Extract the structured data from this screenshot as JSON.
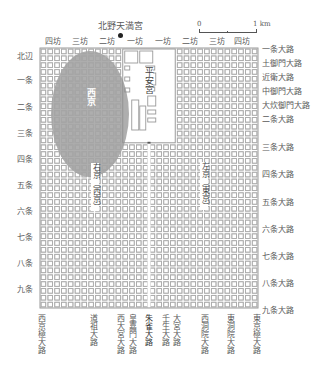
{
  "title": "北野天満宮",
  "landmark": {
    "label": "北野天満宮",
    "marker": "dot-marker"
  },
  "scale_bar": {
    "start": "0",
    "end": "1 km"
  },
  "top_bo_labels": [
    "四坊",
    "三坊",
    "二坊",
    "一坊",
    "一坊",
    "二坊",
    "三坊",
    "四坊"
  ],
  "left_jo_labels": [
    "北辺",
    "一条",
    "二条",
    "三条",
    "四条",
    "五条",
    "六条",
    "七条",
    "八条",
    "九条"
  ],
  "right_road_labels": [
    "一条大路",
    "土御門大路",
    "近衛大路",
    "中御門大路",
    "大炊御門大路",
    "二条大路",
    "三条大路",
    "四条大路",
    "五条大路",
    "六条大路",
    "七条大路",
    "八条大路",
    "九条大路"
  ],
  "bottom_road_labels": [
    "西京極大路",
    "道祖大路",
    "西大宮大路",
    "皇嘉門大路",
    "朱雀大路",
    "壬生大路",
    "大宮大路",
    "西洞院大路",
    "東洞院大路",
    "東京極大路"
  ],
  "areas": {
    "palace": "平安宮",
    "nishi_kyo_highlight": "西京",
    "ukyo": "右京（西京）",
    "sakyo": "左京（東京）"
  },
  "colors": {
    "grid_line": "#9a9a9a",
    "block_fill": "#ffffff",
    "highlight": "#8f8f8f",
    "text": "#5a5a5a",
    "background": "#ffffff"
  }
}
